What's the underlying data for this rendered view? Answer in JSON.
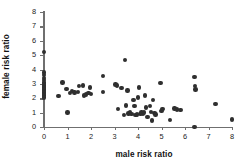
{
  "chart_data": {
    "type": "scatter",
    "title": "",
    "xlabel": "male risk ratio",
    "ylabel": "female risk ratio",
    "xlim": [
      0,
      8
    ],
    "ylim": [
      0,
      8
    ],
    "xticks": [
      0,
      1,
      2,
      3,
      4,
      5,
      6,
      7,
      8
    ],
    "yticks": [
      0,
      1,
      2,
      3,
      4,
      5,
      6,
      7,
      8
    ],
    "xtick_labels": [
      "0",
      "1",
      "2",
      "3",
      "4",
      "5",
      "6",
      "7",
      "8"
    ],
    "ytick_labels": [
      "0",
      "1",
      "2",
      "3",
      "4",
      "5",
      "6",
      "7",
      "8"
    ],
    "grid": false,
    "legend": null,
    "marker": "circle",
    "marker_color": "#2f2f2f",
    "axis_color": "#6f6f6f",
    "points": [
      {
        "x": 0.0,
        "y": 5.2
      },
      {
        "x": 0.0,
        "y": 3.8
      },
      {
        "x": 0.0,
        "y": 3.6
      },
      {
        "x": 0.0,
        "y": 3.4
      },
      {
        "x": 0.0,
        "y": 3.25
      },
      {
        "x": 0.0,
        "y": 3.1
      },
      {
        "x": 0.0,
        "y": 3.0
      },
      {
        "x": 0.0,
        "y": 2.9
      },
      {
        "x": 0.0,
        "y": 2.8
      },
      {
        "x": 0.0,
        "y": 2.7
      },
      {
        "x": 0.0,
        "y": 2.6
      },
      {
        "x": 0.0,
        "y": 2.5
      },
      {
        "x": 0.0,
        "y": 2.4
      },
      {
        "x": 0.0,
        "y": 2.3
      },
      {
        "x": 0.0,
        "y": 2.2
      },
      {
        "x": 0.0,
        "y": 2.05
      },
      {
        "x": 0.62,
        "y": 2.15
      },
      {
        "x": 0.78,
        "y": 3.1
      },
      {
        "x": 0.95,
        "y": 2.65
      },
      {
        "x": 1.0,
        "y": 1.02
      },
      {
        "x": 1.1,
        "y": 2.35
      },
      {
        "x": 1.2,
        "y": 2.5
      },
      {
        "x": 1.3,
        "y": 2.4
      },
      {
        "x": 1.45,
        "y": 2.45
      },
      {
        "x": 1.5,
        "y": 2.85
      },
      {
        "x": 1.65,
        "y": 2.9
      },
      {
        "x": 1.7,
        "y": 2.2
      },
      {
        "x": 1.78,
        "y": 2.25
      },
      {
        "x": 1.9,
        "y": 2.35
      },
      {
        "x": 1.95,
        "y": 2.75
      },
      {
        "x": 2.0,
        "y": 2.3
      },
      {
        "x": 2.5,
        "y": 3.55
      },
      {
        "x": 2.52,
        "y": 2.45
      },
      {
        "x": 3.05,
        "y": 2.95
      },
      {
        "x": 3.1,
        "y": 2.9
      },
      {
        "x": 3.15,
        "y": 1.25
      },
      {
        "x": 3.3,
        "y": 2.7
      },
      {
        "x": 3.4,
        "y": 0.82
      },
      {
        "x": 3.45,
        "y": 4.68
      },
      {
        "x": 3.5,
        "y": 1.5
      },
      {
        "x": 3.55,
        "y": 2.55
      },
      {
        "x": 3.6,
        "y": 0.95
      },
      {
        "x": 3.65,
        "y": 1.0
      },
      {
        "x": 3.72,
        "y": 0.92
      },
      {
        "x": 3.8,
        "y": 1.9
      },
      {
        "x": 3.85,
        "y": 1.45
      },
      {
        "x": 3.9,
        "y": 0.85
      },
      {
        "x": 3.95,
        "y": 0.88
      },
      {
        "x": 4.0,
        "y": 2.05
      },
      {
        "x": 4.05,
        "y": 2.75
      },
      {
        "x": 4.1,
        "y": 0.9
      },
      {
        "x": 4.15,
        "y": 1.0
      },
      {
        "x": 4.2,
        "y": 0.95
      },
      {
        "x": 4.25,
        "y": 1.02
      },
      {
        "x": 4.3,
        "y": 2.2
      },
      {
        "x": 4.35,
        "y": 1.35
      },
      {
        "x": 4.4,
        "y": 0.7
      },
      {
        "x": 4.5,
        "y": 1.45
      },
      {
        "x": 4.55,
        "y": 1.05
      },
      {
        "x": 4.6,
        "y": 0.45
      },
      {
        "x": 4.65,
        "y": 1.9
      },
      {
        "x": 4.7,
        "y": 0.98
      },
      {
        "x": 4.75,
        "y": 0.88
      },
      {
        "x": 4.95,
        "y": 3.05
      },
      {
        "x": 5.0,
        "y": 1.12
      },
      {
        "x": 5.05,
        "y": 1.25
      },
      {
        "x": 5.35,
        "y": 0.48
      },
      {
        "x": 5.55,
        "y": 1.3
      },
      {
        "x": 5.65,
        "y": 1.22
      },
      {
        "x": 5.8,
        "y": 1.2
      },
      {
        "x": 6.4,
        "y": 3.5
      },
      {
        "x": 6.42,
        "y": 2.85
      },
      {
        "x": 6.45,
        "y": 2.6
      },
      {
        "x": 6.4,
        "y": 0.0
      },
      {
        "x": 7.3,
        "y": 1.62
      },
      {
        "x": 8.0,
        "y": 0.52
      }
    ]
  }
}
